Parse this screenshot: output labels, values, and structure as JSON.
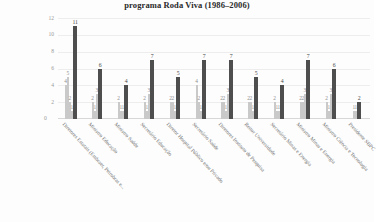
{
  "chart_data": {
    "type": "bar",
    "title": "programa Roda Viva (1986–2006)",
    "xlabel": "",
    "ylabel": "",
    "ylim": [
      0,
      12
    ],
    "yticks": [
      12,
      10,
      8,
      6,
      4,
      2,
      0
    ],
    "grid": true,
    "legend": "none",
    "categories": [
      "Diretores Estatais (Embraer, Petrobras e...",
      "Ministro Educação",
      "Ministro Saúde",
      "Secretário Educação",
      "Diretor Hospital Público e/ou Privado",
      "Secretário Saúde",
      "Diretores Instituto de Pesquisa",
      "Reitor Universidade",
      "Secretário Minas e Energia",
      "Ministro Minas e Energia",
      "Ministro Ciência e Tecnologia",
      "Presidente SBPC"
    ],
    "groups": [
      {
        "category": "Diretores Estatais (Embraer, Petrobras e...",
        "bars": [
          {
            "value": 4,
            "label": "4",
            "major": false
          },
          {
            "value": 5,
            "label": "5",
            "major": false
          },
          {
            "value": 2,
            "label": "2",
            "major": false
          },
          {
            "value": 1,
            "label": "1",
            "major": false
          },
          {
            "value": 11,
            "label": "11",
            "major": true
          }
        ]
      },
      {
        "category": "Ministro Educação",
        "bars": [
          {
            "value": 2,
            "label": "2",
            "major": false
          },
          {
            "value": 1,
            "label": "1",
            "major": false
          },
          {
            "value": 3,
            "label": "3",
            "major": false
          },
          {
            "value": 6,
            "label": "6",
            "major": true
          }
        ]
      },
      {
        "category": "Ministro Saúde",
        "bars": [
          {
            "value": 2,
            "label": "2",
            "major": false
          },
          {
            "value": 1,
            "label": "1",
            "major": false
          },
          {
            "value": 1,
            "label": "1",
            "major": false
          },
          {
            "value": 4,
            "label": "4",
            "major": true
          }
        ]
      },
      {
        "category": "Secretário Educação",
        "bars": [
          {
            "value": 2,
            "label": "2",
            "major": false
          },
          {
            "value": 1,
            "label": "1",
            "major": false
          },
          {
            "value": 3,
            "label": "3",
            "major": false
          },
          {
            "value": 7,
            "label": "7",
            "major": true
          }
        ]
      },
      {
        "category": "Diretor Hospital Público e/ou Privado",
        "bars": [
          {
            "value": 2,
            "label": "2",
            "major": false
          },
          {
            "value": 2,
            "label": "2",
            "major": false
          },
          {
            "value": 1,
            "label": "1",
            "major": false
          },
          {
            "value": 5,
            "label": "5",
            "major": true
          }
        ]
      },
      {
        "category": "Secretário Saúde",
        "bars": [
          {
            "value": 4,
            "label": "4",
            "major": false
          },
          {
            "value": 2,
            "label": "2",
            "major": false
          },
          {
            "value": 1,
            "label": "1",
            "major": false
          },
          {
            "value": 7,
            "label": "7",
            "major": true
          }
        ]
      },
      {
        "category": "Diretores Instituto de Pesquisa",
        "bars": [
          {
            "value": 2,
            "label": "2",
            "major": false
          },
          {
            "value": 2,
            "label": "2",
            "major": false
          },
          {
            "value": 1,
            "label": "1",
            "major": false
          },
          {
            "value": 3,
            "label": "3",
            "major": false
          },
          {
            "value": 7,
            "label": "7",
            "major": true
          }
        ]
      },
      {
        "category": "Reitor Universidade",
        "bars": [
          {
            "value": 2,
            "label": "2",
            "major": false
          },
          {
            "value": 2,
            "label": "2",
            "major": false
          },
          {
            "value": 1,
            "label": "1",
            "major": false
          },
          {
            "value": 5,
            "label": "5",
            "major": true
          }
        ]
      },
      {
        "category": "Secretário Minas e Energia",
        "bars": [
          {
            "value": 2,
            "label": "2",
            "major": false
          },
          {
            "value": 1,
            "label": "1",
            "major": false
          },
          {
            "value": 1,
            "label": "1",
            "major": false
          },
          {
            "value": 4,
            "label": "4",
            "major": true
          }
        ]
      },
      {
        "category": "Ministro Minas e Energia",
        "bars": [
          {
            "value": 2,
            "label": "2",
            "major": false
          },
          {
            "value": 2,
            "label": "2",
            "major": false
          },
          {
            "value": 3,
            "label": "3",
            "major": false
          },
          {
            "value": 7,
            "label": "7",
            "major": true
          }
        ]
      },
      {
        "category": "Ministro Ciência e Tecnologia",
        "bars": [
          {
            "value": 2,
            "label": "2",
            "major": false
          },
          {
            "value": 1,
            "label": "1",
            "major": false
          },
          {
            "value": 3,
            "label": "3",
            "major": false
          },
          {
            "value": 6,
            "label": "6",
            "major": true
          }
        ]
      },
      {
        "category": "Presidente SBPC",
        "bars": [
          {
            "value": 1,
            "label": "1",
            "major": false
          },
          {
            "value": 1,
            "label": "1",
            "major": false
          },
          {
            "value": 2,
            "label": "2",
            "major": true
          }
        ]
      }
    ],
    "colors": {
      "major_bar": "#4e4e4e",
      "minor_bar": "#c9c9c9",
      "grid": "#ededed",
      "text": "#6e6e6e"
    }
  }
}
